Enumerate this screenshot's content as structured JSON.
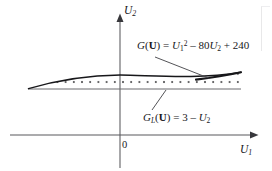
{
  "figure": {
    "type": "diagram",
    "background_color": "#ffffff",
    "line_color": "#3a3a3e",
    "curve_color": "#17171a",
    "hatch_color": "#17171a"
  },
  "axes": {
    "x_axis": {
      "label_plain": "U1",
      "label_base": "U",
      "label_sub": "1",
      "name": "x-axis",
      "arrow": true,
      "y_pixel": 135,
      "x_start": 10,
      "x_end": 256
    },
    "y_axis": {
      "label_plain": "U2",
      "label_base": "U",
      "label_sub": "2",
      "name": "y-axis",
      "arrow": true,
      "x_pixel": 120,
      "y_start": 14,
      "y_end": 168
    },
    "origin": {
      "label": "0",
      "x_pixel": 120,
      "y_pixel": 135
    }
  },
  "curves": {
    "parabola": {
      "name": "limit-state-curve",
      "equation_plain": "G(U) = U1^2 - 80U2 + 240",
      "parts": {
        "fn_name": "G",
        "open_paren": "(",
        "vector": "U",
        "close_paren": ")",
        "equals": " = ",
        "term1_base": "U",
        "term1_sub": "1",
        "term1_sup": "2",
        "minus": " – ",
        "term2_coeff": "80",
        "term2_base": "U",
        "term2_sub": "2",
        "plus": " + ",
        "term3": "240"
      }
    },
    "limit_line": {
      "name": "linear-limit-line",
      "equation_plain": "GL(U) = 3 - U2",
      "parts": {
        "fn_name": "G",
        "fn_sub": "L",
        "open_paren": "(",
        "vector": "U",
        "close_paren": ")",
        "equals": " = ",
        "term1": "3",
        "minus": " – ",
        "term2_base": "U",
        "term2_sub": "2"
      },
      "y_pixel": 89,
      "x_start": 28,
      "x_end": 241
    }
  },
  "region": {
    "name": "failure-region",
    "fill": "cross-hatch-diamond-lattice"
  },
  "leaders": [
    {
      "name": "leader-g",
      "from_x": 155,
      "from_y": 57,
      "to_x": 209,
      "to_y": 78
    },
    {
      "name": "leader-gl",
      "from_x": 166,
      "from_y": 90,
      "to_x": 152,
      "to_y": 110
    }
  ]
}
